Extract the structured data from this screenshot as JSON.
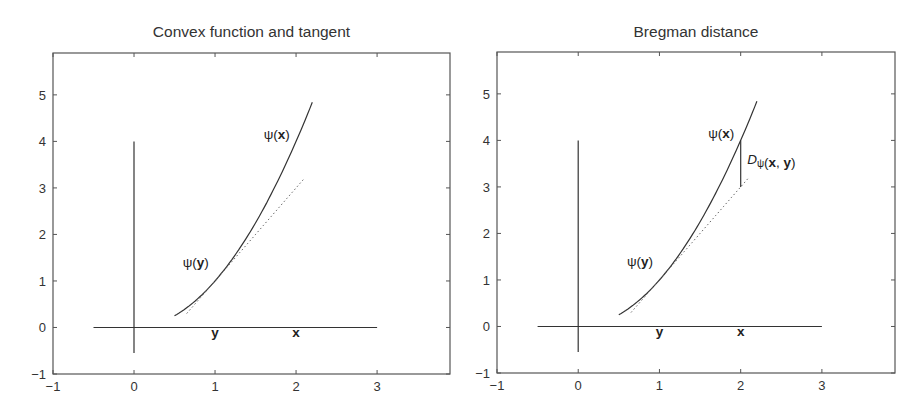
{
  "chart_data": [
    {
      "type": "line",
      "title": "Convex function and tangent",
      "xlabel": "",
      "ylabel": "",
      "xlim": [
        -1,
        3.9
      ],
      "ylim": [
        -1,
        5.9
      ],
      "xticks": [
        -1,
        0,
        1,
        2,
        3
      ],
      "yticks": [
        -1,
        0,
        1,
        2,
        3,
        4,
        5
      ],
      "xtick_labels": [
        "−1",
        "0",
        "1",
        "2",
        "3"
      ],
      "ytick_labels": [
        "−1",
        "0",
        "1",
        "2",
        "3",
        "4",
        "5"
      ],
      "grid": false,
      "legend": null,
      "series": [
        {
          "name": "psi(x) = x^2",
          "style": "solid",
          "x_range": [
            0.5,
            2.2
          ],
          "function": "x^2"
        },
        {
          "name": "tangent at y=1",
          "style": "dotted",
          "x_range": [
            0.65,
            2.1
          ],
          "function": "2x-1"
        },
        {
          "name": "horizontal axis line",
          "style": "solid",
          "x": [
            -0.5,
            3
          ],
          "y": [
            0,
            0
          ]
        },
        {
          "name": "vertical axis line",
          "style": "solid",
          "x": [
            0,
            0
          ],
          "y": [
            -0.55,
            4
          ]
        }
      ],
      "annotations": [
        {
          "text_prefix": "ψ(",
          "text_bold": "x",
          "text_suffix": ")",
          "x": 1.6,
          "y": 4.05
        },
        {
          "text_prefix": "ψ(",
          "text_bold": "y",
          "text_suffix": ")",
          "x": 0.6,
          "y": 1.3
        },
        {
          "text_bold": "y",
          "x": 1.0,
          "y": -0.2
        },
        {
          "text_bold": "x",
          "x": 2.0,
          "y": -0.2
        }
      ]
    },
    {
      "type": "line",
      "title": "Bregman distance",
      "xlabel": "",
      "ylabel": "",
      "xlim": [
        -1,
        3.9
      ],
      "ylim": [
        -1,
        5.9
      ],
      "xticks": [
        -1,
        0,
        1,
        2,
        3
      ],
      "yticks": [
        -1,
        0,
        1,
        2,
        3,
        4,
        5
      ],
      "xtick_labels": [
        "−1",
        "0",
        "1",
        "2",
        "3"
      ],
      "ytick_labels": [
        "−1",
        "0",
        "1",
        "2",
        "3",
        "4",
        "5"
      ],
      "grid": false,
      "legend": null,
      "series": [
        {
          "name": "psi(x) = x^2",
          "style": "solid",
          "x_range": [
            0.5,
            2.2
          ],
          "function": "x^2"
        },
        {
          "name": "tangent at y=1",
          "style": "dotted",
          "x_range": [
            0.65,
            2.1
          ],
          "function": "2x-1"
        },
        {
          "name": "Bregman distance segment",
          "style": "solid",
          "x": [
            2,
            2
          ],
          "y": [
            3,
            4
          ]
        },
        {
          "name": "horizontal axis line",
          "style": "solid",
          "x": [
            -0.5,
            3
          ],
          "y": [
            0,
            0
          ]
        },
        {
          "name": "vertical axis line",
          "style": "solid",
          "x": [
            0,
            0
          ],
          "y": [
            -0.55,
            4
          ]
        }
      ],
      "annotations": [
        {
          "text_prefix": "ψ(",
          "text_bold": "x",
          "text_suffix": ")",
          "x": 1.6,
          "y": 4.05
        },
        {
          "text_prefix": "ψ(",
          "text_bold": "y",
          "text_suffix": ")",
          "x": 0.6,
          "y": 1.3
        },
        {
          "text_italic": "D",
          "text_sub": "ψ",
          "text_prefix": "(",
          "text_bold": "x",
          "text_mid": ", ",
          "text_bold2": "y",
          "text_suffix": ")",
          "x": 2.08,
          "y": 3.5
        },
        {
          "text_bold": "y",
          "x": 1.0,
          "y": -0.2
        },
        {
          "text_bold": "x",
          "x": 2.0,
          "y": -0.2
        }
      ]
    }
  ],
  "panels": [
    {
      "left": 0,
      "plot": {
        "x0": 53,
        "y0": 53,
        "x1": 450,
        "y1": 374
      }
    },
    {
      "left": 444,
      "plot": {
        "x0": 53,
        "y0": 52,
        "x1": 451,
        "y1": 373
      }
    }
  ],
  "colors": {
    "line": "#333333",
    "frame": "#555555",
    "text": "#333333",
    "background": "#ffffff"
  }
}
